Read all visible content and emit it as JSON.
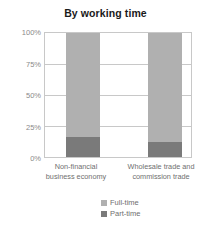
{
  "chart_data": {
    "type": "bar",
    "subtype": "100% stacked column",
    "title": "By working time",
    "xlabel": "",
    "ylabel": "",
    "ylim": [
      0,
      100
    ],
    "yticks": [
      0,
      25,
      50,
      75,
      100
    ],
    "ytick_labels": [
      "0%",
      "25%",
      "50%",
      "75%",
      "100%"
    ],
    "grid": true,
    "legend_position": "bottom",
    "categories": [
      "Non-financial business economy",
      "Wholesale trade and commission trade"
    ],
    "category_lines": [
      [
        "Non-financial",
        "business economy"
      ],
      [
        "Wholesale trade and",
        "commission trade"
      ]
    ],
    "series": [
      {
        "name": "Full-time",
        "color": "#b0b0b0",
        "values": [
          84,
          88
        ]
      },
      {
        "name": "Part-time",
        "color": "#7a7a7a",
        "values": [
          16,
          12
        ]
      }
    ],
    "colors": {
      "full_time": "#b0b0b0",
      "part_time": "#7a7a7a",
      "axis": "#c8c8c8",
      "text": "#6f6f6f",
      "title": "#1a1a1a",
      "background": "#ffffff"
    }
  },
  "legend": {
    "items": [
      {
        "label": "Full-time",
        "color": "#b0b0b0"
      },
      {
        "label": "Part-time",
        "color": "#7a7a7a"
      }
    ]
  }
}
